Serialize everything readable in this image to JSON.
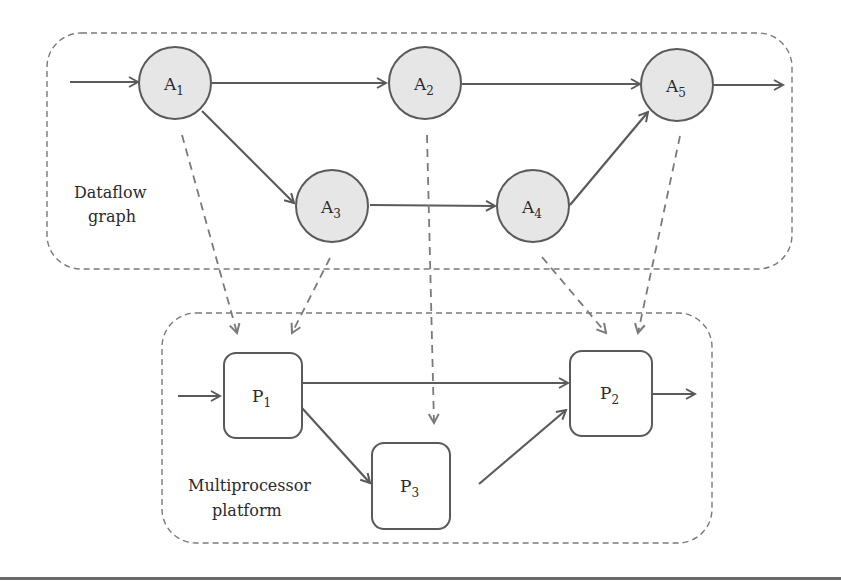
{
  "diagram": {
    "colors": {
      "stroke": "#5a5a5a",
      "dashed": "#7a7a7a",
      "node_fill": "#e6e6e6",
      "box_fill": "#ffffff",
      "text": "#2a2a2a"
    },
    "groups": {
      "dataflow": {
        "line1": "Dataflow",
        "line2": "graph"
      },
      "platform": {
        "line1": "Multiprocessor",
        "line2": "platform"
      }
    },
    "actors": [
      {
        "id": "A1",
        "letter": "A",
        "sub": "1"
      },
      {
        "id": "A2",
        "letter": "A",
        "sub": "2"
      },
      {
        "id": "A3",
        "letter": "A",
        "sub": "3"
      },
      {
        "id": "A4",
        "letter": "A",
        "sub": "4"
      },
      {
        "id": "A5",
        "letter": "A",
        "sub": "5"
      }
    ],
    "processors": [
      {
        "id": "P1",
        "letter": "P",
        "sub": "1"
      },
      {
        "id": "P2",
        "letter": "P",
        "sub": "2"
      },
      {
        "id": "P3",
        "letter": "P",
        "sub": "3"
      }
    ],
    "dataflow_edges": [
      [
        "in",
        "A1"
      ],
      [
        "A1",
        "A2"
      ],
      [
        "A1",
        "A3"
      ],
      [
        "A2",
        "A5"
      ],
      [
        "A3",
        "A4"
      ],
      [
        "A4",
        "A5"
      ],
      [
        "A5",
        "out"
      ]
    ],
    "platform_edges": [
      [
        "in",
        "P1"
      ],
      [
        "P1",
        "P2"
      ],
      [
        "P1",
        "P3"
      ],
      [
        "P3",
        "P2"
      ],
      [
        "P2",
        "out"
      ]
    ],
    "mappings": [
      [
        "A1",
        "P1"
      ],
      [
        "A3",
        "P1"
      ],
      [
        "A2",
        "P3"
      ],
      [
        "A4",
        "P2"
      ],
      [
        "A5",
        "P2"
      ]
    ]
  }
}
